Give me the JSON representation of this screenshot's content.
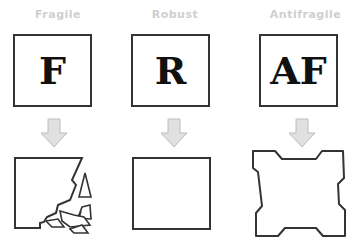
{
  "columns": [
    {
      "label": "Fragile",
      "letter": "F",
      "outcome": "shattered-square"
    },
    {
      "label": "Robust",
      "letter": "R",
      "outcome": "intact-square"
    },
    {
      "label": "Antifragile",
      "letter": "AF",
      "outcome": "reinforced-square"
    }
  ],
  "colors": {
    "label": "#cfcfcf",
    "stroke": "#333333",
    "arrow_fill": "#e0e0e0",
    "arrow_stroke": "#bdbdbd"
  }
}
